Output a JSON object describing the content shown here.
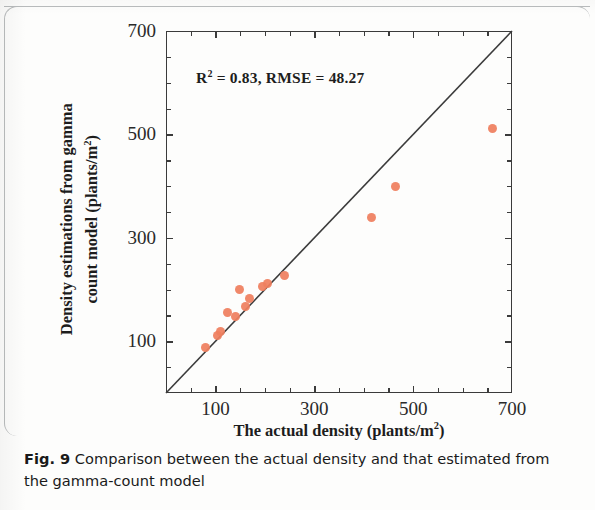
{
  "figure": {
    "caption_label": "Fig. 9",
    "caption_text": "Comparison between the actual density and that estimated from the gamma-count model"
  },
  "annotation": {
    "r_symbol": "R",
    "r_exponent": "2",
    "stats_text": " = 0.83, RMSE = 48.27"
  },
  "axes": {
    "x_title_main": "The actual density (plants/m",
    "x_title_sup": "2",
    "x_title_end": ")",
    "y_title_line1": "Density estimations from gamma",
    "y_title_line2_main": "count model (plants/m",
    "y_title_line2_sup": "2",
    "y_title_line2_end": ")"
  },
  "chart_data": {
    "type": "scatter",
    "title": "",
    "xlabel": "The actual density (plants/m2)",
    "ylabel": "Density estimations from gamma count model (plants/m2)",
    "xlim": [
      0,
      700
    ],
    "ylim": [
      0,
      700
    ],
    "xticks": [
      100,
      300,
      500,
      700
    ],
    "yticks": [
      100,
      300,
      500,
      700
    ],
    "minor_tick_step": 50,
    "grid": false,
    "legend": false,
    "marker_color": "#ef7f5f",
    "line_color": "#3b3b3b",
    "reference_line": {
      "label": "1:1 line",
      "from": [
        0,
        0
      ],
      "to": [
        700,
        700
      ]
    },
    "annotations": [
      {
        "text": "R2 = 0.83, RMSE = 48.27",
        "x": 250,
        "y": 620
      }
    ],
    "r_squared": 0.83,
    "rmse": 48.27,
    "points": [
      {
        "x": 80,
        "y": 88
      },
      {
        "x": 105,
        "y": 112
      },
      {
        "x": 110,
        "y": 118
      },
      {
        "x": 125,
        "y": 155
      },
      {
        "x": 140,
        "y": 148
      },
      {
        "x": 148,
        "y": 200
      },
      {
        "x": 160,
        "y": 168
      },
      {
        "x": 168,
        "y": 182
      },
      {
        "x": 195,
        "y": 205
      },
      {
        "x": 205,
        "y": 212
      },
      {
        "x": 240,
        "y": 228
      },
      {
        "x": 415,
        "y": 340
      },
      {
        "x": 465,
        "y": 400
      },
      {
        "x": 660,
        "y": 512
      }
    ]
  }
}
